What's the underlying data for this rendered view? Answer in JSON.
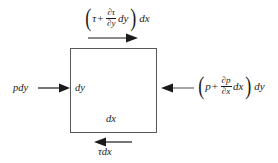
{
  "figure": {
    "background_color": "#ffffff",
    "line_color": "#58585a",
    "text_color": "#1a1a1a"
  },
  "element": {
    "name": "fluid-element",
    "height_label": "dy",
    "width_label": "dx"
  },
  "forces": {
    "left": {
      "label": "pdy",
      "description": "pressure force on left face",
      "arrow_direction": "right"
    },
    "right": {
      "open_paren": "(",
      "base": "p",
      "operator": "+",
      "numerator": "∂p",
      "denominator": "∂x",
      "differential": "dx",
      "close_paren": ")",
      "trailing": "dy",
      "description": "pressure force on right face",
      "arrow_direction": "left"
    },
    "top": {
      "open_paren": "(",
      "base": "τ",
      "operator": "+",
      "numerator": "∂τ",
      "denominator": "∂y",
      "differential": "dy",
      "close_paren": ")",
      "trailing": "dx",
      "description": "shear force on top face",
      "arrow_direction": "right"
    },
    "bottom": {
      "label": "τdx",
      "description": "shear force on bottom face",
      "arrow_direction": "left"
    }
  }
}
